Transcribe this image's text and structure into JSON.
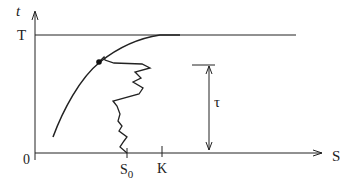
{
  "diagram": {
    "axes": {
      "y_label": "t",
      "x_label": "S",
      "origin_label": "0"
    },
    "levels": {
      "T_label": "T"
    },
    "ticks": {
      "s0_label": "S",
      "s0_subscript": "0",
      "k_label": "K"
    },
    "tau_label": "τ",
    "colors": {
      "line": "#222222",
      "background": "#ffffff"
    }
  }
}
